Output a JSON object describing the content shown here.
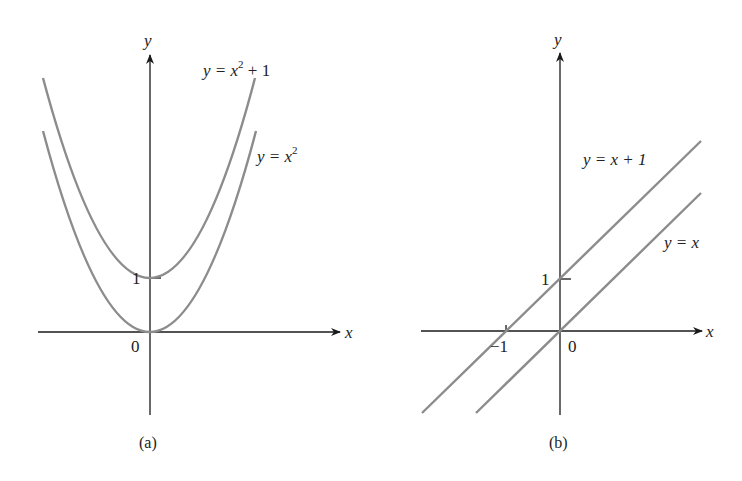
{
  "figure": {
    "panels": [
      {
        "id": "a",
        "caption": "(a)",
        "axes": {
          "x_label": "x",
          "y_label": "y",
          "origin_label": "0",
          "y_tick_label": "1"
        },
        "curves": [
          {
            "name": "parabola-shifted",
            "label_lhs": "y = x",
            "label_sup": "2",
            "label_rhs": " + 1",
            "equation": "y = x^2 + 1"
          },
          {
            "name": "parabola",
            "label_lhs": "y = x",
            "label_sup": "2",
            "label_rhs": "",
            "equation": "y = x^2"
          }
        ]
      },
      {
        "id": "b",
        "caption": "(b)",
        "axes": {
          "x_label": "x",
          "y_label": "y",
          "origin_label": "0",
          "y_tick_label": "1",
          "x_tick_label": "−1"
        },
        "lines": [
          {
            "name": "line-shifted",
            "label": "y = x + 1",
            "equation": "y = x + 1"
          },
          {
            "name": "line",
            "label": "y = x",
            "equation": "y = x"
          }
        ]
      }
    ],
    "colors": {
      "axis": "#1a1a1a",
      "curve": "#8c8c8c",
      "text": "#222222"
    }
  }
}
